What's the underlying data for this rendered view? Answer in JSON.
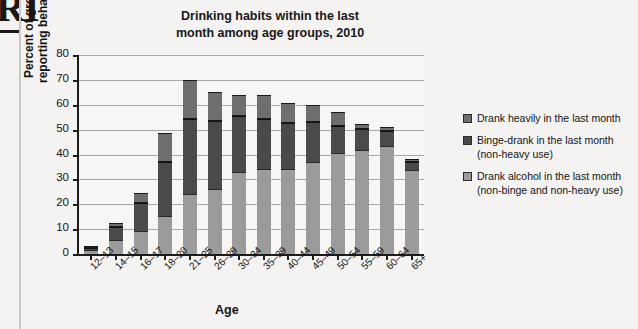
{
  "page": {
    "running_head": "RI",
    "background_color": "#f4f3f1"
  },
  "chart_data": {
    "type": "bar",
    "subtype": "stacked-vertical",
    "title": "Drinking habits within the last month among age groups, 2010",
    "title_line1": "Drinking habits within the last",
    "title_line2": "month among age groups, 2010",
    "xlabel": "Age",
    "ylabel": "Percent of group reporting behavior",
    "ylabel_line1": "Percent of group",
    "ylabel_line2": "reporting behavior",
    "ylim": [
      0,
      80
    ],
    "yticks": [
      0,
      10,
      20,
      30,
      40,
      50,
      60,
      70,
      80
    ],
    "grid": "horizontal",
    "legend_position": "right",
    "categories": [
      "12–13",
      "14–15",
      "16–17",
      "18–20",
      "21–25",
      "26–29",
      "30–34",
      "35–39",
      "40–44",
      "45–49",
      "50–54",
      "55–59",
      "60–64",
      "65+"
    ],
    "series": [
      {
        "name": "Drank alcohol in the last month (non-binge and non-heavy use)",
        "legend_line1": "Drank alcohol in the last month",
        "legend_line2": "(non-binge and non-heavy use)",
        "color": "#9b9b9b",
        "values": [
          1.6,
          5.7,
          9.3,
          15.2,
          24.0,
          26.3,
          32.8,
          34.3,
          34.2,
          36.9,
          40.5,
          41.7,
          43.4,
          33.6
        ]
      },
      {
        "name": "Binge-drank in the last month (non-heavy use)",
        "legend_line1": "Binge-drank in the last month",
        "legend_line2": "(non-heavy use)",
        "color": "#4a4a4a",
        "values": [
          0.9,
          5.2,
          11.1,
          21.9,
          30.4,
          27.2,
          22.7,
          20.0,
          18.3,
          16.3,
          11.1,
          8.6,
          6.1,
          3.4
        ]
      },
      {
        "name": "Drank heavily in the last month",
        "legend_line1": "Drank heavily in the last month",
        "legend_line2": "",
        "color": "#6e6e6e",
        "values": [
          0.6,
          1.4,
          4.0,
          11.6,
          15.4,
          11.5,
          8.4,
          9.6,
          8.2,
          6.6,
          5.3,
          2.0,
          1.4,
          1.3
        ]
      }
    ],
    "totals": [
      3.1,
      12.3,
      24.4,
      48.7,
      69.8,
      65.0,
      63.9,
      63.9,
      60.7,
      59.8,
      56.9,
      52.3,
      50.9,
      38.3
    ],
    "legend_order_top_to_bottom": [
      "Drank heavily in the last month",
      "Binge-drank in the last month (non-heavy use)",
      "Drank alcohol in the last month (non-binge and non-heavy use)"
    ]
  }
}
